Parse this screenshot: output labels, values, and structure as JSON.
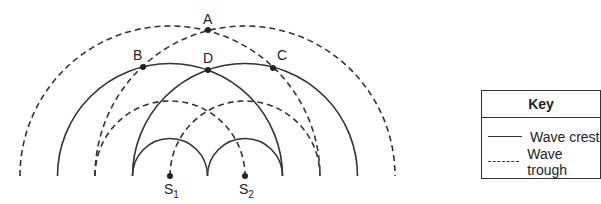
{
  "diagram": {
    "sources": [
      {
        "label": "S",
        "subscript": "1",
        "x": 170,
        "y": 176
      },
      {
        "label": "S",
        "subscript": "2",
        "x": 245,
        "y": 176
      }
    ],
    "points": [
      {
        "label": "A",
        "x": 208,
        "y": 30
      },
      {
        "label": "B",
        "x": 143,
        "y": 67
      },
      {
        "label": "C",
        "x": 273,
        "y": 68
      },
      {
        "label": "D",
        "x": 208,
        "y": 70
      }
    ],
    "crest_radii": [
      37.5,
      112.5
    ],
    "trough_radii": [
      75,
      150
    ],
    "key": {
      "title": "Key",
      "items": [
        {
          "style": "solid",
          "label": "Wave crest"
        },
        {
          "style": "dashed",
          "label": "Wave trough"
        }
      ]
    },
    "colors": {
      "line": "#333333",
      "text": "#222222",
      "background": "#ffffff"
    }
  }
}
